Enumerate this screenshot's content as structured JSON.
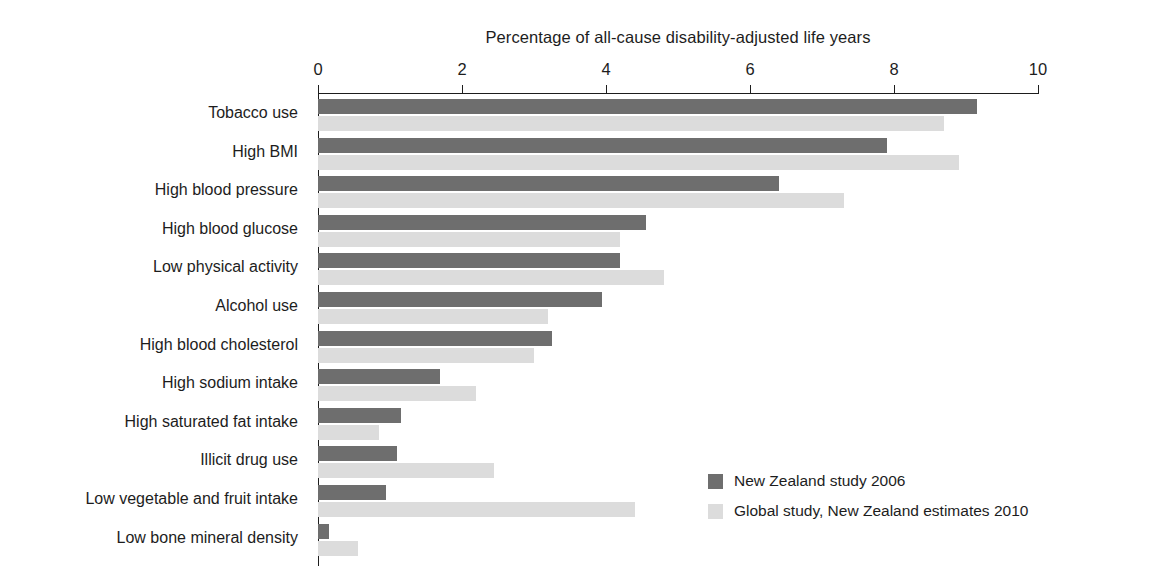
{
  "chart_data": {
    "type": "bar",
    "orientation": "horizontal",
    "title": "Percentage of all-cause disability-adjusted life years",
    "xlabel": "Percentage of all-cause disability-adjusted life years",
    "ylabel": "",
    "xlim": [
      0,
      10
    ],
    "xticks": [
      0,
      2,
      4,
      6,
      8,
      10
    ],
    "xtick_labels": [
      "0",
      "2",
      "4",
      "6",
      "8",
      "10"
    ],
    "grid": false,
    "legend_position": "bottom-right",
    "categories": [
      "Tobacco use",
      "High BMI",
      "High blood pressure",
      "High blood glucose",
      "Low physical activity",
      "Alcohol use",
      "High blood cholesterol",
      "High sodium intake",
      "High saturated fat intake",
      "Illicit drug use",
      "Low vegetable and fruit intake",
      "Low bone mineral density"
    ],
    "series": [
      {
        "name": "New Zealand study 2006",
        "color": "#6e6e6e",
        "values": [
          9.15,
          7.9,
          6.4,
          4.55,
          4.2,
          3.95,
          3.25,
          1.7,
          1.15,
          1.1,
          0.95,
          0.15
        ]
      },
      {
        "name": "Global study, New Zealand estimates 2010",
        "color": "#dcdcdc",
        "values": [
          8.7,
          8.9,
          7.3,
          4.2,
          4.8,
          3.2,
          3.0,
          2.2,
          0.85,
          2.45,
          4.4,
          0.55
        ]
      }
    ]
  },
  "legend": {
    "items": [
      {
        "label": "New Zealand study 2006",
        "swatch": "dark"
      },
      {
        "label": "Global study, New Zealand estimates 2010",
        "swatch": "light"
      }
    ]
  }
}
